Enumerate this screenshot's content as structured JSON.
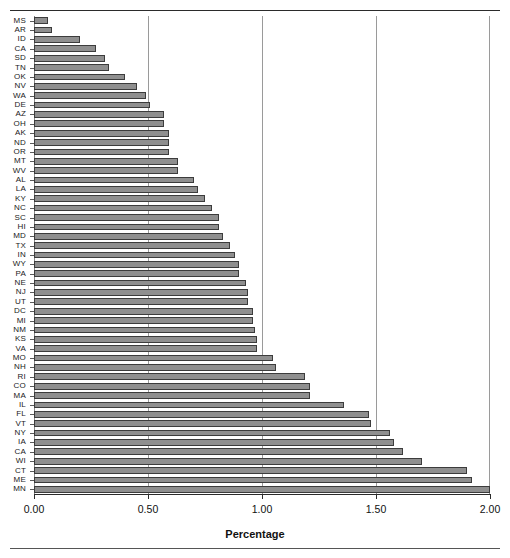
{
  "chart_data": {
    "type": "bar",
    "orientation": "horizontal",
    "title": "",
    "xlabel": "Percentage",
    "ylabel": "",
    "xlim": [
      0.0,
      2.0
    ],
    "xticks": [
      "0.00",
      "0.50",
      "1.00",
      "1.50",
      "2.00"
    ],
    "xtick_values": [
      0.0,
      0.5,
      1.0,
      1.5,
      2.0
    ],
    "grid": "vertical",
    "legend": "none",
    "bar_color": "#8f8f8f",
    "bar_edge_color": "#3c3c3c",
    "categories": [
      "MS",
      "AR",
      "ID",
      "CA",
      "SD",
      "TN",
      "OK",
      "NV",
      "WA",
      "DE",
      "AZ",
      "OH",
      "AK",
      "ND",
      "OR",
      "MT",
      "WV",
      "AL",
      "LA",
      "KY",
      "NC",
      "SC",
      "HI",
      "MD",
      "TX",
      "IN",
      "WY",
      "PA",
      "NE",
      "NJ",
      "UT",
      "DC",
      "MI",
      "NM",
      "KS",
      "VA",
      "MO",
      "NH",
      "RI",
      "CO",
      "MA",
      "IL",
      "FL",
      "VT",
      "NY",
      "IA",
      "CA2",
      "WI",
      "CT",
      "ME",
      "MN"
    ],
    "tick_labels": [
      "MS",
      "AR",
      "ID",
      "CA",
      "SD",
      "TN",
      "OK",
      "NV",
      "WA",
      "DE",
      "AZ",
      "OH",
      "AK",
      "ND",
      "OR",
      "MT",
      "WV",
      "AL",
      "LA",
      "KY",
      "NC",
      "SC",
      "HI",
      "MD",
      "TX",
      "IN",
      "WY",
      "PA",
      "NE",
      "NJ",
      "UT",
      "DC",
      "MI",
      "NM",
      "KS",
      "VA",
      "MO",
      "NH",
      "RI",
      "CO",
      "MA",
      "IL",
      "FL",
      "VT",
      "NY",
      "IA",
      "CA",
      "WI",
      "CT",
      "ME",
      "MN"
    ],
    "values": [
      0.06,
      0.08,
      0.2,
      0.27,
      0.31,
      0.33,
      0.4,
      0.45,
      0.49,
      0.51,
      0.57,
      0.57,
      0.59,
      0.59,
      0.59,
      0.63,
      0.63,
      0.7,
      0.72,
      0.75,
      0.78,
      0.81,
      0.81,
      0.83,
      0.86,
      0.88,
      0.9,
      0.9,
      0.93,
      0.94,
      0.94,
      0.96,
      0.96,
      0.97,
      0.98,
      0.98,
      1.05,
      1.06,
      1.19,
      1.21,
      1.21,
      1.36,
      1.47,
      1.48,
      1.56,
      1.58,
      1.62,
      1.7,
      1.9,
      1.92,
      2.0
    ]
  },
  "axis": {
    "x_label_text": "Percentage"
  }
}
